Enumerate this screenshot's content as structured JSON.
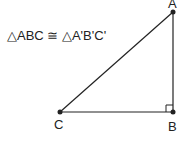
{
  "diagram": {
    "statement": "△ABC ≅ △A'B'C'",
    "vertices": {
      "A": {
        "label": "A",
        "x": 173,
        "y": 12
      },
      "B": {
        "label": "B",
        "x": 173,
        "y": 112
      },
      "C": {
        "label": "C",
        "x": 60,
        "y": 112
      }
    },
    "right_angle_at": "B",
    "colors": {
      "stroke": "#222222",
      "text": "#222222",
      "background": "#ffffff"
    }
  }
}
